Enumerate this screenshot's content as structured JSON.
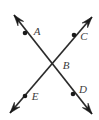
{
  "figure": {
    "background_color": "#ffffff",
    "line_color": "#2b2b2b",
    "label_color": "#3b3b3b",
    "point_color": "#1a1a1a",
    "width": 99,
    "height": 120
  },
  "labels": {
    "a": "A",
    "b": "B",
    "c": "C",
    "d": "D",
    "e": "E"
  },
  "points": [
    {
      "name": "A",
      "label": "A",
      "x": 25,
      "y": 33,
      "label_x": 37,
      "label_y": 32
    },
    {
      "name": "B",
      "label": "B",
      "x": 57,
      "y": 63,
      "label_x": 66,
      "label_y": 66
    },
    {
      "name": "C",
      "label": "C",
      "x": 74,
      "y": 35,
      "label_x": 84,
      "label_y": 37
    },
    {
      "name": "D",
      "label": "D",
      "x": 73,
      "y": 94,
      "label_x": 83,
      "label_y": 90
    },
    {
      "name": "E",
      "label": "E",
      "x": 25,
      "y": 96,
      "label_x": 35,
      "label_y": 97
    }
  ],
  "lines": [
    {
      "name": "line-AD",
      "through": [
        "A",
        "B",
        "D"
      ],
      "from": {
        "x": 14,
        "y": 15
      },
      "to": {
        "x": 92,
        "y": 114
      },
      "arrows": "both"
    },
    {
      "name": "line-CE",
      "through": [
        "C",
        "B",
        "E"
      ],
      "from": {
        "x": 92,
        "y": 17
      },
      "to": {
        "x": 10,
        "y": 113
      },
      "arrows": "both"
    }
  ],
  "arrowheads": [
    {
      "name": "arrow-upper-left",
      "tip_x": 14,
      "tip_y": 15,
      "angle_deg": 231.8
    },
    {
      "name": "arrow-lower-right",
      "tip_x": 92,
      "tip_y": 114,
      "angle_deg": 51.8
    },
    {
      "name": "arrow-upper-right",
      "tip_x": 92,
      "tip_y": 17,
      "angle_deg": 310.5
    },
    {
      "name": "arrow-lower-left",
      "tip_x": 10,
      "tip_y": 113,
      "angle_deg": 130.5
    }
  ]
}
